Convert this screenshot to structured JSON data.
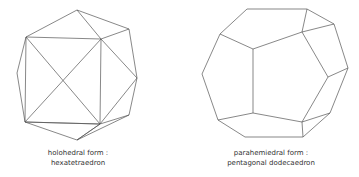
{
  "figures": [
    {
      "id": "left",
      "caption_line1": "holohedral form :",
      "caption_line2": "hexatetraedron"
    },
    {
      "id": "right",
      "caption_line1": "parahemiedral form :",
      "caption_line2": "pentagonal dodecaedron"
    }
  ],
  "colors": {
    "stroke": "#555555",
    "background": "#ffffff",
    "text": "#333333"
  }
}
